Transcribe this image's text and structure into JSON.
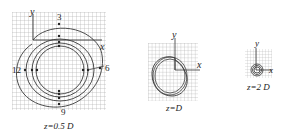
{
  "panels": [
    {
      "id": "panel-1",
      "caption": "z=0.5 D",
      "axis_x_label": "x",
      "axis_y_label": "y",
      "markers": {
        "top": "3",
        "right": "6",
        "bottom": "9",
        "left": "12"
      }
    },
    {
      "id": "panel-2",
      "caption": "z=D",
      "axis_x_label": "x",
      "axis_y_label": "y"
    },
    {
      "id": "panel-3",
      "caption": "z=2 D",
      "axis_x_label": "x",
      "axis_y_label": "y"
    }
  ],
  "colors": {
    "grid": "#9a9a9a",
    "curve": "#3a3a3a",
    "text": "#222222"
  }
}
